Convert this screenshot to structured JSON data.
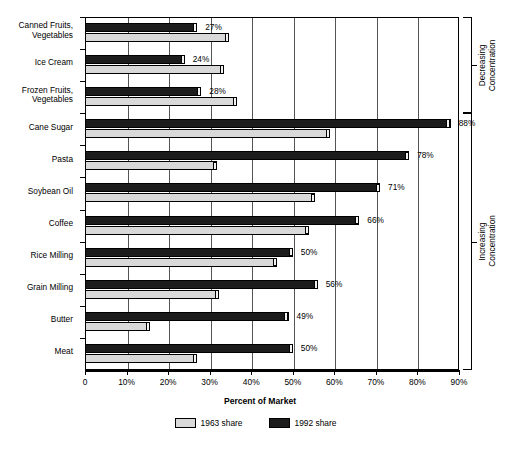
{
  "chart_data": {
    "type": "bar",
    "orientation": "horizontal",
    "title": "",
    "xlabel": "Percent of Market",
    "ylabel": "",
    "xlim": [
      0,
      90
    ],
    "xticks": [
      0,
      10,
      20,
      30,
      40,
      50,
      60,
      70,
      80,
      90
    ],
    "xtick_labels": [
      "0",
      "10%",
      "20%",
      "30%",
      "40%",
      "50%",
      "60%",
      "70%",
      "80%",
      "90%"
    ],
    "grid": true,
    "legend_position": "bottom",
    "categories": [
      "Canned Fruits,\nVegetables",
      "Ice Cream",
      "Frozen Fruits,\nVegetables",
      "Cane Sugar",
      "Pasta",
      "Soybean Oil",
      "Coffee",
      "Rice Milling",
      "Grain Milling",
      "Butter",
      "Meat"
    ],
    "series": [
      {
        "name": "1963 share",
        "color": "#d9d9d9",
        "values": [
          34.7,
          33.5,
          36.6,
          59.0,
          31.8,
          55.4,
          54.0,
          46.3,
          32.3,
          15.7,
          27.0
        ]
      },
      {
        "name": "1992 share",
        "color": "#1c1c1c",
        "values": [
          27,
          24,
          28,
          88,
          78,
          71,
          66,
          50,
          56,
          49,
          50
        ]
      }
    ],
    "data_labels": [
      "27%",
      "24%",
      "28%",
      "88%",
      "78%",
      "71%",
      "66%",
      "50%",
      "56%",
      "49%",
      "50%"
    ],
    "annotations": [
      {
        "text": "Decreasing\nConcentration",
        "covers": [
          "Canned Fruits, Vegetables",
          "Ice Cream",
          "Frozen Fruits, Vegetables"
        ]
      },
      {
        "text": "Increasing\nConcentration",
        "covers": [
          "Cane Sugar",
          "Pasta",
          "Soybean Oil",
          "Coffee",
          "Rice Milling",
          "Grain Milling",
          "Butter",
          "Meat"
        ]
      }
    ]
  },
  "legend": {
    "items": [
      {
        "label": "1963 share",
        "swatch": "light"
      },
      {
        "label": "1992 share",
        "swatch": "dark"
      }
    ]
  },
  "axis": {
    "x_title": "Percent of Market"
  }
}
